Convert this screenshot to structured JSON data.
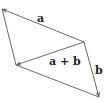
{
  "diagram": {
    "colors": {
      "line": "#6a6a6a",
      "label": "#222222",
      "background": "#ffffff"
    },
    "vertices": {
      "top_left": [
        2,
        9
      ],
      "right_middle": [
        84,
        42
      ],
      "bottom_left": [
        16,
        65
      ],
      "bottom_right": [
        99,
        97
      ]
    },
    "vectors": [
      {
        "name": "a",
        "from": "right_middle",
        "to": "top_left",
        "label": "a"
      },
      {
        "name": "b",
        "from": "right_middle",
        "to": "bottom_right",
        "label": "b"
      },
      {
        "name": "a-plus-b",
        "from": "right_middle",
        "to": "bottom_left",
        "label": "a + b"
      },
      {
        "name": "b-translated",
        "from": "top_left",
        "to": "bottom_left",
        "label": ""
      },
      {
        "name": "a-translated",
        "from": "bottom_right",
        "to": "bottom_left",
        "label": ""
      }
    ],
    "labels": {
      "a": "a",
      "b": "b",
      "sum": "a + b"
    }
  }
}
